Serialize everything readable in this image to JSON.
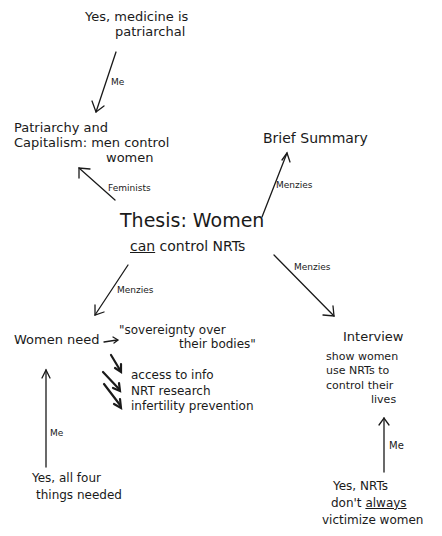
{
  "diagram": {
    "type": "argument-map",
    "style": "hand-drawn",
    "nodes": {
      "yes_medicine": {
        "lines": [
          "Yes, medicine is",
          "patriarchal"
        ]
      },
      "patriarchy": {
        "lines": [
          "Patriarchy and",
          "Capitalism: men control",
          "women"
        ]
      },
      "brief_summary": {
        "lines": [
          "Brief Summary"
        ]
      },
      "thesis": {
        "line1": "Thesis:  Women",
        "line2_emph": "can",
        "line2_rest": " control NRTs"
      },
      "women_need": {
        "label": "Women  need",
        "items": [
          "\"sovereignty over",
          "their bodies\"",
          "access to info",
          "NRT research",
          "infertility prevention"
        ],
        "asterisk": "*"
      },
      "interview": {
        "title": "Interview",
        "lines": [
          "show women",
          "use NRTs to",
          "control their",
          "lives"
        ]
      },
      "yes_four": {
        "lines": [
          "Yes, all four",
          "things needed"
        ]
      },
      "yes_nrts": {
        "line1": "Yes,  NRTs",
        "line2_pre": "don't ",
        "line2_emph": "always",
        "line3": "victimize women"
      }
    },
    "edges": [
      {
        "from": "yes_medicine",
        "to": "patriarchy",
        "label": "Me"
      },
      {
        "from": "thesis",
        "to": "patriarchy",
        "label": "Feminists"
      },
      {
        "from": "thesis",
        "to": "brief_summary",
        "label": "Menzies"
      },
      {
        "from": "thesis",
        "to": "women_need",
        "label": "Menzies"
      },
      {
        "from": "thesis",
        "to": "interview",
        "label": "Menzies"
      },
      {
        "from": "yes_four",
        "to": "women_need",
        "label": "Me"
      },
      {
        "from": "yes_nrts",
        "to": "interview",
        "label": "Me"
      }
    ],
    "edge_labels": {
      "me_top": "Me",
      "feminists": "Feminists",
      "menzies_summary": "Menzies",
      "menzies_women": "Menzies",
      "menzies_interview": "Menzies",
      "me_left": "Me",
      "me_right": "Me"
    }
  }
}
